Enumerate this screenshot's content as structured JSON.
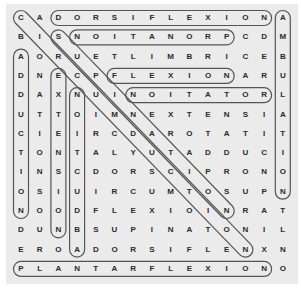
{
  "puzzle": {
    "rows": [
      "CADORSIFLEXIONA",
      "BISNOITANORPCDM",
      "AORUETLIMBRICEB",
      "DNECPFLEXIONARU",
      "DAXNUINOITATORL",
      "UTTOIMNEXTENSIA",
      "CIEIRCDAROTATIT",
      "TONTALYUTADDUCI",
      "INSCDORSCIPRONO",
      "OSIUIRCUMTOSUPN",
      "NOODFLEXIOINRAT",
      "DUNBSUPINATONIL",
      "EROADORSIFLENXN",
      "PLANTARFLEXIONO"
    ],
    "found_words": [
      {
        "word": "DORSIFLEXION",
        "start": [
          0,
          2
        ],
        "end": [
          0,
          13
        ]
      },
      {
        "word": "PRONATION",
        "start": [
          1,
          11
        ],
        "end": [
          1,
          3
        ]
      },
      {
        "word": "FLEXION",
        "start": [
          3,
          5
        ],
        "end": [
          3,
          11
        ]
      },
      {
        "word": "ROTATION",
        "start": [
          4,
          13
        ],
        "end": [
          4,
          6
        ]
      },
      {
        "word": "PLANTARFLEXION",
        "start": [
          13,
          0
        ],
        "end": [
          13,
          13
        ]
      },
      {
        "word": "ADDUCTION",
        "start": [
          2,
          0
        ],
        "end": [
          10,
          0
        ]
      },
      {
        "word": "EXTENSION",
        "start": [
          3,
          2
        ],
        "end": [
          11,
          2
        ]
      },
      {
        "word": "ABDUCTION",
        "start": [
          12,
          3
        ],
        "end": [
          4,
          3
        ]
      },
      {
        "word": "AMBULATION",
        "start": [
          0,
          14
        ],
        "end": [
          9,
          14
        ]
      },
      {
        "word": "CIRCUMDUCTION",
        "start": [
          0,
          0
        ],
        "end": [
          12,
          12
        ]
      },
      {
        "word": "SUPINATION",
        "start": [
          1,
          2
        ],
        "end": [
          10,
          11
        ]
      }
    ]
  },
  "colors": {
    "background": "#ebebeb",
    "letter": "#2a2a2a",
    "oval_stroke": "#555555"
  }
}
